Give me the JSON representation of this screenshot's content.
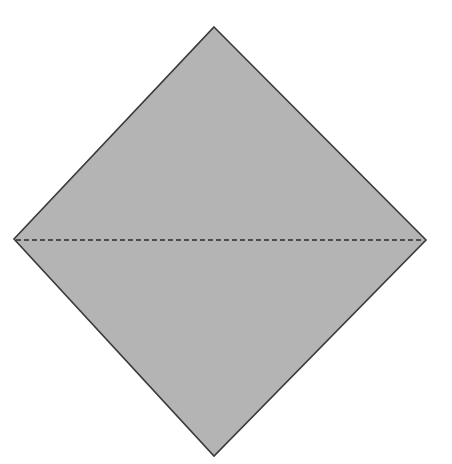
{
  "diagram": {
    "canvas": {
      "width": 452,
      "height": 464,
      "background": "#ffffff"
    },
    "shape": {
      "kind": "diamond",
      "vertices": {
        "top": [
          214,
          27
        ],
        "right": [
          426,
          240
        ],
        "bottom": [
          214,
          456
        ],
        "left": [
          14,
          239
        ]
      },
      "fill": "#b4b4b4",
      "stroke": "#3a3a3a",
      "stroke_width": 1.6
    },
    "fold_line": {
      "style": "dashed",
      "from": [
        16,
        240
      ],
      "to": [
        424,
        240
      ],
      "stroke": "#2e2e2e",
      "stroke_width": 1.6,
      "dash": "5 3"
    }
  }
}
